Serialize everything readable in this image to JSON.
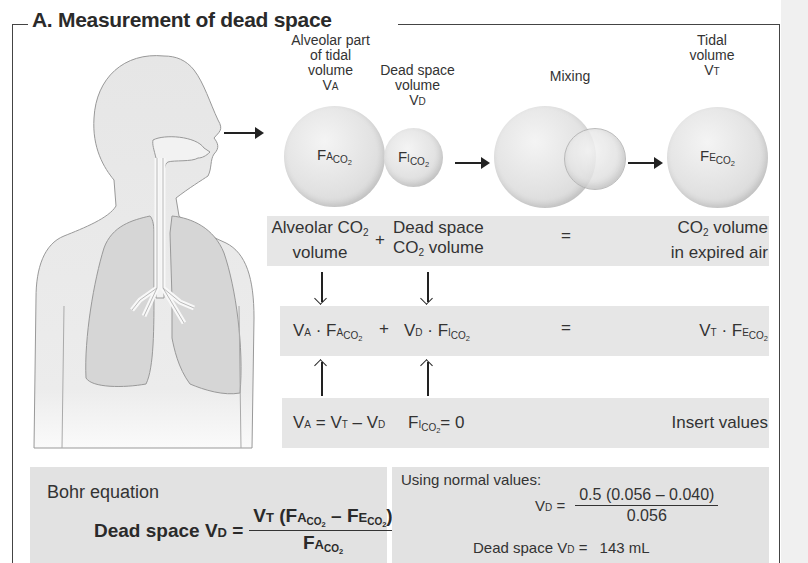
{
  "title": "A. Measurement of dead space",
  "top_labels": {
    "alveolar": [
      "Alveolar part",
      "of tidal",
      "volume"
    ],
    "alveolar_symbol": "V",
    "alveolar_symbol_sub": "A",
    "dead_space": [
      "Dead space",
      "volume"
    ],
    "dead_space_symbol": "V",
    "dead_space_symbol_sub": "D",
    "mixing": "Mixing",
    "tidal": [
      "Tidal",
      "volume"
    ],
    "tidal_symbol": "V",
    "tidal_symbol_sub": "T"
  },
  "spheres": {
    "alveolar": {
      "main": "F",
      "sc": "A",
      "sub": "CO2"
    },
    "dead_space": {
      "main": "F",
      "sc": "I",
      "sub": "CO2"
    },
    "tidal": {
      "main": "F",
      "sc": "E",
      "sub": "CO2"
    }
  },
  "row1": {
    "alveolar": [
      "Alveolar CO",
      "volume"
    ],
    "plus": "+",
    "dead_space": [
      "Dead space",
      "CO",
      "volume"
    ],
    "equals": "=",
    "expired": [
      "CO",
      "volume",
      "in expired air"
    ],
    "two": "2"
  },
  "row2": {
    "left": "V",
    "left_sc": "A",
    "dot": " · F",
    "left_f_sc": "A",
    "sub": "CO2",
    "plus": "+",
    "mid": "V",
    "mid_sc": "D",
    "mid_dot": " · F",
    "mid_f_sc": "I",
    "equals": "=",
    "right": "V",
    "right_sc": "T",
    "right_dot": " · F",
    "right_f_sc": "E"
  },
  "row3": {
    "eq1_v": "V",
    "eq1_a": "A",
    "eq1_eq": " = V",
    "eq1_t": "T",
    "eq1_minus": " – V",
    "eq1_d": "D",
    "eq2_f": "F",
    "eq2_i": "I",
    "eq2_sub": "CO2",
    "eq2_val": "= 0",
    "insert": "Insert values"
  },
  "bohr": {
    "heading": "Bohr equation",
    "label": "Dead space V",
    "label_sc": "D",
    "equals": " =",
    "num_v": "V",
    "num_t": "T",
    "num_open": " (F",
    "num_a": "A",
    "num_minus": " – F",
    "num_e": "E",
    "num_close": ")",
    "den_f": "F",
    "den_a": "A",
    "sub": "CO2"
  },
  "normal": {
    "heading": "Using normal values:",
    "vd": "V",
    "vd_sc": "D",
    "eq": " =",
    "numerator": "0.5 (0.056 – 0.040)",
    "denominator": "0.056",
    "result_label": "Dead space V",
    "result_sc": "D",
    "result_eq": " =",
    "result_value": "143 mL"
  },
  "colors": {
    "band": "#e6e6e6",
    "box": "#e2e2e2",
    "body": "#e8e8e8",
    "lung": "#d4d4d4",
    "line": "#444444"
  }
}
